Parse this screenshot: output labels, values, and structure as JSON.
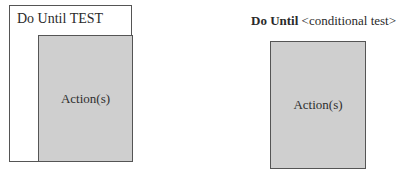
{
  "left_diagram": {
    "title": "Do Until TEST",
    "inner_label": "Action(s)"
  },
  "right_diagram": {
    "keyword": "Do Until",
    "condition": " <conditional test>",
    "inner_label": "Action(s)"
  },
  "colors": {
    "action_fill": "#cfcfcf",
    "border": "#555555",
    "background": "#ffffff"
  }
}
